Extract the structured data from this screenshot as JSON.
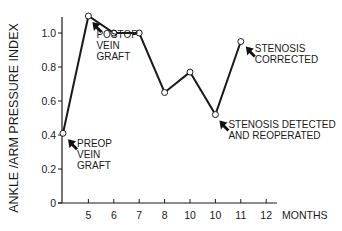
{
  "chart_data": {
    "type": "line",
    "title": "",
    "xlabel": "MONTHS",
    "ylabel": "ANKLE /ARM  PRESSURE INDEX",
    "x_tick_labels": [
      "",
      "5",
      "6",
      "7",
      "8",
      "10",
      "10",
      "11",
      "12"
    ],
    "y_ticks": [
      0,
      0.2,
      0.4,
      0.6,
      0.8,
      1.0
    ],
    "y_tick_labels": [
      "0",
      "0.2",
      "0.4",
      "0.6",
      "0.8",
      "1.0"
    ],
    "ylim": [
      0,
      1.12
    ],
    "grid": false,
    "legend": null,
    "series": [
      {
        "name": "Ankle/Arm Pressure Index",
        "points": [
          {
            "slot": 0,
            "x_label": "preop",
            "y": 0.41
          },
          {
            "slot": 1,
            "x_label": "5",
            "y": 1.1
          },
          {
            "slot": 2,
            "x_label": "6",
            "y": 1.0
          },
          {
            "slot": 3,
            "x_label": "7",
            "y": 1.0
          },
          {
            "slot": 4,
            "x_label": "8",
            "y": 0.65
          },
          {
            "slot": 5,
            "x_label": "10",
            "y": 0.77
          },
          {
            "slot": 6,
            "x_label": "10",
            "y": 0.52
          },
          {
            "slot": 7,
            "x_label": "11",
            "y": 0.95
          }
        ]
      }
    ],
    "annotations": [
      {
        "point_slot": 0,
        "lines": [
          "PREOP",
          "VEIN",
          "GRAFT"
        ]
      },
      {
        "point_slot": 1,
        "lines": [
          "POSTOP",
          "VEIN",
          "GRAFT"
        ]
      },
      {
        "point_slot": 6,
        "lines": [
          "STENOSIS DETECTED",
          "AND REOPERATED"
        ]
      },
      {
        "point_slot": 7,
        "lines": [
          "STENOSIS",
          "CORRECTED"
        ]
      }
    ]
  }
}
